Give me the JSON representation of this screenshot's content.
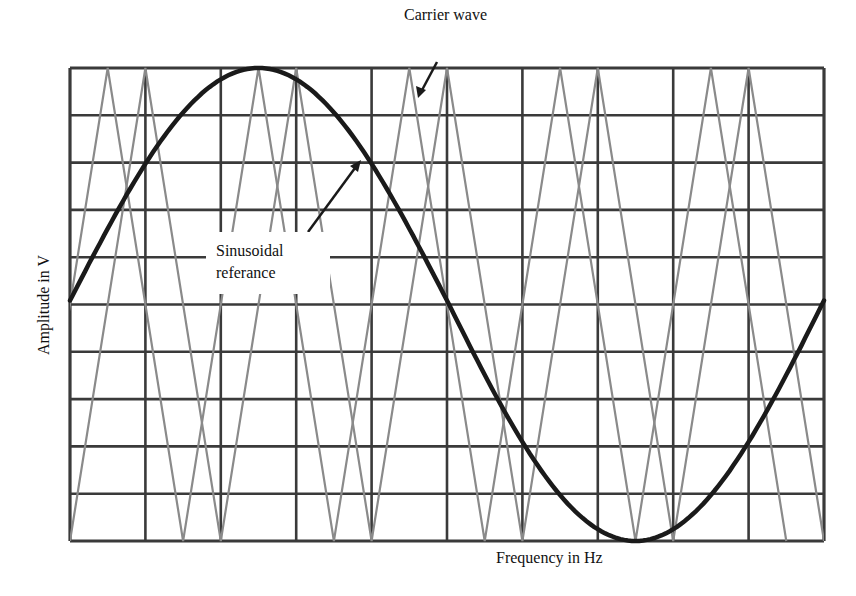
{
  "chart_data": {
    "type": "line",
    "title": "",
    "xlabel": "Frequency in Hz",
    "ylabel": "Amplitude in V",
    "grid": true,
    "grid_divisions": {
      "x": 10,
      "y": 10
    },
    "x": [
      0,
      0.25,
      0.5,
      0.75,
      1.0
    ],
    "series": [
      {
        "name": "Sinusoidal referance",
        "style": "thick dark curve",
        "description": "one full sine period across plot width, starting at zero crossing, peak at 1/4, trough at 3/4",
        "values": [
          0,
          1,
          0,
          -1,
          0
        ]
      },
      {
        "name": "Carrier wave",
        "style": "thin gray triangular waves (two interleaved)",
        "description": "two triangle waves with period = 2 grid divisions, offset ~0.5 division",
        "wave_a_peaks_div": [
          0.5,
          2.5,
          4.5,
          6.5,
          8.5
        ],
        "wave_b_peaks_div": [
          1.0,
          3.0,
          5.0,
          7.0,
          9.0
        ],
        "amplitude": [
          -1,
          1
        ]
      }
    ],
    "annotations": [
      {
        "text": "Carrier wave",
        "arrow": true
      },
      {
        "text": "Sinusoidal referance",
        "arrow": true
      }
    ]
  },
  "labels": {
    "carrier": "Carrier wave",
    "sine_line1": "Sinusoidal",
    "sine_line2": "referance",
    "x_axis": "Frequency in Hz",
    "y_axis": "Amplitude in V"
  },
  "colors": {
    "grid": "#3a3a3a",
    "carrier": "#8a8a8a",
    "sine": "#1a1a1a",
    "background": "#ffffff"
  }
}
